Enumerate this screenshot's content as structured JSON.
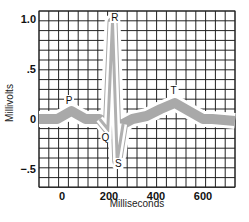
{
  "chart_data": {
    "type": "line",
    "title": "",
    "xlabel": "Milliseconds",
    "ylabel": "Millivolts",
    "xlim": [
      -100,
      740
    ],
    "ylim": [
      -0.7,
      1.0
    ],
    "grid": true,
    "x_ticks": [
      0,
      200,
      400,
      600
    ],
    "x_tick_labels": [
      "0",
      "200",
      "400",
      "600"
    ],
    "y_ticks": [
      1.0,
      0.5,
      0,
      -0.5
    ],
    "y_tick_labels": [
      "1.0",
      ".5",
      "0",
      "−.5"
    ],
    "series": [
      {
        "name": "ECG waveform",
        "x": [
          -100,
          -20,
          40,
          100,
          160,
          195,
          215,
          235,
          260,
          300,
          360,
          420,
          480,
          540,
          600,
          640,
          740
        ],
        "y": [
          0,
          0,
          0.08,
          0,
          0,
          -0.1,
          0.97,
          -0.42,
          -0.05,
          0,
          0.03,
          0.1,
          0.16,
          0.08,
          0,
          0,
          -0.02
        ]
      }
    ],
    "annotations": [
      {
        "label": "P",
        "x": 30,
        "y": 0.15
      },
      {
        "label": "Q",
        "x": 185,
        "y": -0.22
      },
      {
        "label": "R",
        "x": 225,
        "y": 0.98
      },
      {
        "label": "S",
        "x": 240,
        "y": -0.48
      },
      {
        "label": "T",
        "x": 475,
        "y": 0.25
      }
    ]
  }
}
